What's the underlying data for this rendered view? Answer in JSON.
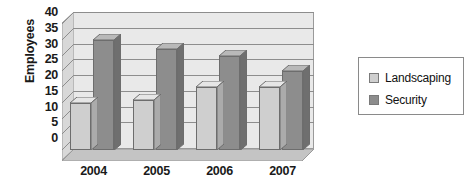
{
  "chart_data": {
    "type": "bar",
    "title": "",
    "subtitle": "",
    "xlabel": "",
    "ylabel": "Employees",
    "categories": [
      "2004",
      "2005",
      "2006",
      "2007"
    ],
    "series": [
      {
        "name": "Landscaping",
        "values": [
          15,
          16,
          20,
          20
        ],
        "color": "#cfcfcf"
      },
      {
        "name": "Security",
        "values": [
          35,
          32,
          30,
          25
        ],
        "color": "#8d8d8d"
      }
    ],
    "ylim": [
      0,
      40
    ],
    "ytick_values": [
      0,
      5,
      10,
      15,
      20,
      25,
      30,
      35,
      40
    ],
    "ytick_labels": [
      "0",
      "5",
      "10",
      "15",
      "20",
      "25",
      "30",
      "35",
      "40"
    ],
    "grid": true,
    "grid_axis": "y",
    "legend": true,
    "legend_position": "right",
    "style": "3d-bar",
    "annotations": []
  },
  "colors": {
    "landscaping_front": "#cfcfcf",
    "landscaping_top": "#e6e6e6",
    "landscaping_side": "#ababab",
    "security_front": "#8d8d8d",
    "security_top": "#b9b9b9",
    "security_side": "#6f6f6f",
    "plot_back": "#e9e9e9",
    "plot_wall": "#d8d8d8",
    "plot_floor": "#c4c4c4",
    "gridline": "#8d8d8d",
    "axis_text": "#1a1a1a",
    "legend_border": "#8a8a8a",
    "background": "#ffffff"
  },
  "legend": {
    "items": [
      {
        "label": "Landscaping",
        "swatch": "#cfcfcf"
      },
      {
        "label": "Security",
        "swatch": "#8d8d8d"
      }
    ]
  }
}
